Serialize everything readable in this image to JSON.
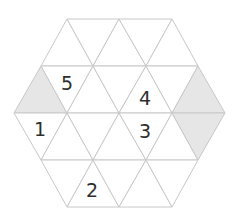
{
  "puzzle": {
    "name": "hexagonal-triangle-grid",
    "colors": {
      "background": "#ffffff",
      "cell": "#ffffff",
      "shaded": "#e6e6e6",
      "grid_line": "#c8c8c8",
      "number": "#2e2e2e"
    },
    "rows_y": [
      19,
      66,
      113,
      160,
      207
    ],
    "cells": [
      {
        "id": "r0c0",
        "pts": "67,19 41,66 93,66",
        "shaded": false
      },
      {
        "id": "r0c1",
        "pts": "67,19 119,19 93,66",
        "shaded": false
      },
      {
        "id": "r0c2",
        "pts": "119,19 93,66 146,66",
        "shaded": false
      },
      {
        "id": "r0c3",
        "pts": "119,19 172,19 146,66",
        "shaded": false
      },
      {
        "id": "r0c4",
        "pts": "172,19 146,66 198,66",
        "shaded": false
      },
      {
        "id": "r1c0",
        "pts": "41,66 14,113 67,113",
        "shaded": true
      },
      {
        "id": "r1c1",
        "pts": "41,66 93,66 67,113",
        "shaded": false
      },
      {
        "id": "r1c2",
        "pts": "93,66 67,113 119,113",
        "shaded": false
      },
      {
        "id": "r1c3",
        "pts": "93,66 146,66 119,113",
        "shaded": false
      },
      {
        "id": "r1c4",
        "pts": "146,66 119,113 172,113",
        "shaded": false
      },
      {
        "id": "r1c5",
        "pts": "146,66 198,66 172,113",
        "shaded": false
      },
      {
        "id": "r1c6",
        "pts": "198,66 172,113 225,113",
        "shaded": true
      },
      {
        "id": "r2c0",
        "pts": "14,113 67,113 41,160",
        "shaded": false
      },
      {
        "id": "r2c1",
        "pts": "67,113 41,160 93,160",
        "shaded": false
      },
      {
        "id": "r2c2",
        "pts": "67,113 119,113 93,160",
        "shaded": false
      },
      {
        "id": "r2c3",
        "pts": "119,113 93,160 146,160",
        "shaded": false
      },
      {
        "id": "r2c4",
        "pts": "119,113 172,113 146,160",
        "shaded": false
      },
      {
        "id": "r2c5",
        "pts": "172,113 146,160 198,160",
        "shaded": false
      },
      {
        "id": "r2c6",
        "pts": "172,113 225,113 198,160",
        "shaded": true
      },
      {
        "id": "r3c0",
        "pts": "41,160 93,160 67,207",
        "shaded": false
      },
      {
        "id": "r3c1",
        "pts": "93,160 67,207 119,207",
        "shaded": false
      },
      {
        "id": "r3c2",
        "pts": "93,160 146,160 119,207",
        "shaded": false
      },
      {
        "id": "r3c3",
        "pts": "146,160 119,207 172,207",
        "shaded": false
      },
      {
        "id": "r3c4",
        "pts": "146,160 198,160 172,207",
        "shaded": false
      }
    ],
    "clues": [
      {
        "value": "5",
        "x": 67,
        "y": 83
      },
      {
        "value": "4",
        "x": 145,
        "y": 98
      },
      {
        "value": "1",
        "x": 40,
        "y": 129
      },
      {
        "value": "3",
        "x": 145,
        "y": 131
      },
      {
        "value": "2",
        "x": 92,
        "y": 190
      }
    ]
  }
}
